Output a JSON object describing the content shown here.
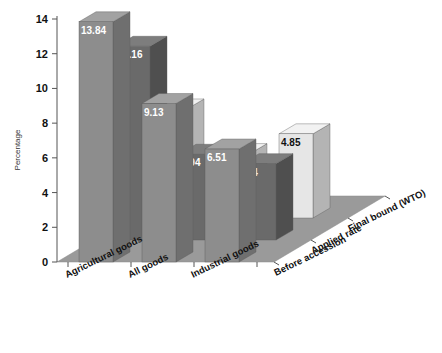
{
  "chart_data": {
    "type": "bar",
    "title": "",
    "subtitle": "",
    "xlabel": "",
    "ylabel": "Percentage",
    "zlabel": "",
    "ylim": [
      0,
      14
    ],
    "yticks": [
      0,
      2,
      4,
      6,
      8,
      10,
      12,
      14
    ],
    "ytick_labels": [
      "0",
      "2",
      "4",
      "6",
      "8",
      "10",
      "12",
      "14"
    ],
    "grid": false,
    "legend_position": "none",
    "three_d": true,
    "categories": [
      "Agricultural goods",
      "All goods",
      "Industrial goods"
    ],
    "series": [
      {
        "name": "Before accession",
        "values": [
          13.84,
          9.13,
          6.51
        ],
        "labels": [
          "13.84",
          "9.13",
          "6.51"
        ],
        "color": "#8d8d8d",
        "side_color": "#6f6f6f",
        "top_color": "#a2a2a2",
        "label_color": "#ffffff"
      },
      {
        "name": "Applied rate",
        "values": [
          11.16,
          4.94,
          4.4
        ],
        "labels": [
          "11.16",
          "4.94",
          "4.4"
        ],
        "color": "#6a6a6a",
        "side_color": "#4f4f4f",
        "top_color": "#7d7d7d",
        "label_color": "#ffffff"
      },
      {
        "name": "Final bound (WTO)",
        "values": [
          6.28,
          3.71,
          4.85
        ],
        "labels": [
          "6.28",
          "3.71",
          "4.85"
        ],
        "color": "#e6e6e6",
        "side_color": "#b4b4b4",
        "top_color": "#f2f2f2",
        "label_color": "#111111"
      }
    ],
    "floor_color": "#9a9a9a",
    "background_color": "#ffffff",
    "annotations": []
  },
  "axes": {
    "y_title": "Percentage",
    "y_ticks": [
      "14",
      "12",
      "10",
      "8",
      "6",
      "4",
      "2",
      "0"
    ]
  },
  "category_labels": [
    "Agricultural goods",
    "All goods",
    "Industrial goods"
  ],
  "series_labels": [
    "Before accession",
    "Applied rate",
    "Final bound (WTO)"
  ],
  "bar_labels": {
    "r0c0": "13.84",
    "r0c1": "9.13",
    "r0c2": "6.51",
    "r1c0": "11.16",
    "r1c1": "4.94",
    "r1c2": "4.4",
    "r2c0": "6.28",
    "r2c1": "3.71",
    "r2c2": "4.85"
  }
}
